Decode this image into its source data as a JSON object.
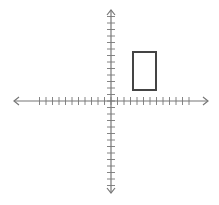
{
  "diagram": {
    "type": "coordinate-plane",
    "origin_px": [
      111,
      101
    ],
    "tick_spacing_px": 6.5,
    "x_axis": {
      "min_px": 14,
      "max_px": 208,
      "ticks_left": 11,
      "ticks_right": 12
    },
    "y_axis": {
      "min_px": 10,
      "max_px": 193,
      "ticks_up": 13,
      "ticks_down": 13
    },
    "rectangle": {
      "x_px": 133,
      "y_px": 52,
      "width_px": 23,
      "height_px": 38,
      "stroke": "#444444"
    },
    "axis_color": "#777777"
  }
}
